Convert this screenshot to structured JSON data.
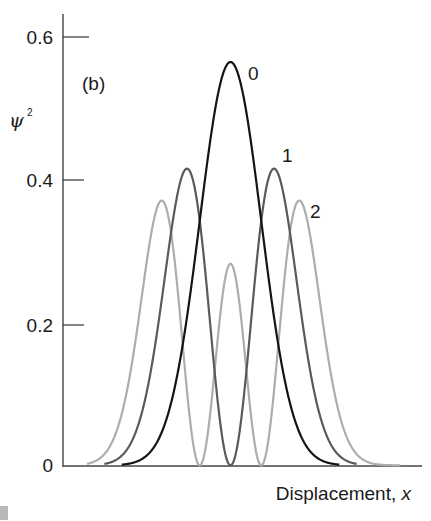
{
  "chart_data": {
    "type": "line",
    "title": "",
    "panel_label": "(b)",
    "xlabel": "Displacement, ",
    "xlabel_var": "x",
    "ylabel": "ψ",
    "ylabel_sup": "2",
    "ylim": [
      0,
      0.6
    ],
    "yticks": [
      0,
      0.2,
      0.4,
      0.6
    ],
    "ytick_labels": [
      "0",
      "0.2",
      "0.4",
      "0.6"
    ],
    "grid": false,
    "legend": "none (curves labeled inline)",
    "xlim": [
      -4.0,
      4.4
    ],
    "series": [
      {
        "name": "0",
        "color": "#111111",
        "x_range": [
          -2.5,
          2.5
        ],
        "peak_values": [
          {
            "x": 0,
            "y": 0.56
          }
        ],
        "x": [
          -2.5,
          -2,
          -1.5,
          -1,
          -0.5,
          0,
          0.5,
          1,
          1.5,
          2,
          2.5
        ],
        "y": [
          0.001,
          0.01,
          0.059,
          0.208,
          0.439,
          0.564,
          0.439,
          0.208,
          0.059,
          0.01,
          0.001
        ]
      },
      {
        "name": "1",
        "color": "#555555",
        "x_range": [
          -2.9,
          2.9
        ],
        "peak_values": [
          {
            "x": -1,
            "y": 0.42
          },
          {
            "x": 1,
            "y": 0.42
          }
        ],
        "x": [
          -2.9,
          -2.5,
          -2,
          -1.5,
          -1,
          -0.5,
          0,
          0.5,
          1,
          1.5,
          2,
          2.5,
          2.9
        ],
        "y": [
          0.002,
          0.007,
          0.041,
          0.178,
          0.415,
          0.439,
          0,
          0.439,
          0.415,
          0.178,
          0.041,
          0.007,
          0.002
        ]
      },
      {
        "name": "2",
        "color": "#a8a8a8",
        "x_range": [
          -3.3,
          3.9
        ],
        "peak_values": [
          {
            "x": -1.51,
            "y": 0.37
          },
          {
            "x": 0,
            "y": 0.28
          },
          {
            "x": 1.51,
            "y": 0.37
          }
        ],
        "x": [
          -3.3,
          -3,
          -2.5,
          -2,
          -1.5,
          -1,
          -0.707,
          -0.5,
          0,
          0.5,
          0.707,
          1,
          1.5,
          2,
          2.5,
          3,
          3.5,
          3.9
        ],
        "y": [
          0.001,
          0.005,
          0.046,
          0.253,
          0.374,
          0.104,
          0,
          0.07,
          0.282,
          0.07,
          0,
          0.104,
          0.374,
          0.253,
          0.046,
          0.005,
          0.0002,
          2e-05
        ]
      }
    ]
  },
  "labels": {
    "panel": "(b)",
    "curve0": "0",
    "curve1": "1",
    "curve2": "2",
    "xaxis": "Displacement, ",
    "xaxis_var": "x",
    "yaxis": "ψ",
    "yaxis_sup": "2",
    "ticks": [
      "0.6",
      "0.4",
      "0.2",
      "0"
    ]
  }
}
